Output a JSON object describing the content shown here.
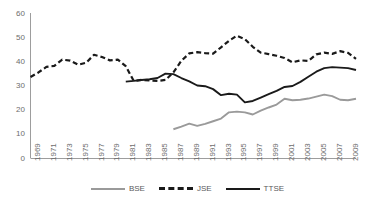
{
  "chart_data": {
    "type": "line",
    "title": "",
    "subtitle": "",
    "xlabel": "",
    "ylabel": "",
    "ylim": [
      0,
      60
    ],
    "ytick_values": [
      0,
      10,
      20,
      30,
      40,
      50,
      60
    ],
    "ytick_labels": [
      "0",
      "10",
      "20",
      "30",
      "40",
      "50",
      "60"
    ],
    "grid": false,
    "legend_position": "bottom",
    "x": [
      1969,
      1970,
      1971,
      1972,
      1973,
      1974,
      1975,
      1976,
      1977,
      1978,
      1979,
      1980,
      1981,
      1982,
      1983,
      1984,
      1985,
      1986,
      1987,
      1988,
      1989,
      1990,
      1991,
      1992,
      1993,
      1994,
      1995,
      1996,
      1997,
      1998,
      1999,
      2000,
      2001,
      2002,
      2003,
      2004,
      2005,
      2006,
      2007,
      2008,
      2009,
      2010
    ],
    "xtick_labels": [
      "1969",
      "1971",
      "1973",
      "1975",
      "1977",
      "1979",
      "1981",
      "1983",
      "1985",
      "1987",
      "1989",
      "1991",
      "1993",
      "1995",
      "1997",
      "1999",
      "2001",
      "2003",
      "2005",
      "2007",
      "2009"
    ],
    "series": [
      {
        "name": "BSE",
        "color": "#9a9a9a",
        "style": "solid",
        "start_year": 1987,
        "values": [
          null,
          null,
          null,
          null,
          null,
          null,
          null,
          null,
          null,
          null,
          null,
          null,
          null,
          null,
          null,
          null,
          null,
          null,
          11.9,
          13.0,
          14.2,
          13.3,
          14.1,
          15.2,
          16.3,
          18.9,
          19.2,
          18.9,
          18.0,
          19.6,
          20.9,
          22.1,
          24.5,
          23.9,
          24.1,
          24.6,
          25.4,
          26.2,
          25.6,
          24.1,
          23.9,
          24.5
        ]
      },
      {
        "name": "JSE",
        "color": "#1a1a1a",
        "style": "dashed",
        "start_year": 1969,
        "values": [
          33.5,
          35.4,
          37.7,
          38.1,
          40.7,
          40.3,
          38.6,
          39.4,
          42.7,
          41.8,
          40.4,
          40.7,
          38.0,
          31.9,
          32.3,
          32.1,
          31.9,
          32.3,
          35.4,
          40.2,
          43.3,
          43.8,
          43.4,
          43.2,
          45.8,
          48.5,
          50.6,
          49.2,
          46.0,
          43.6,
          43.0,
          42.3,
          41.4,
          39.6,
          40.4,
          40.2,
          42.9,
          43.6,
          43.1,
          44.2,
          43.5,
          41.0
        ]
      },
      {
        "name": "TTSE",
        "color": "#1a1a1a",
        "style": "solid",
        "start_year": 1981,
        "values": [
          null,
          null,
          null,
          null,
          null,
          null,
          null,
          null,
          null,
          null,
          null,
          null,
          31.6,
          31.9,
          32.3,
          32.6,
          33.1,
          34.9,
          34.7,
          33.1,
          31.7,
          30.0,
          29.7,
          28.5,
          26.0,
          26.6,
          26.2,
          23.0,
          23.6,
          25.0,
          26.4,
          27.8,
          29.4,
          29.8,
          31.5,
          33.6,
          35.7,
          37.2,
          37.6,
          37.4,
          37.2,
          36.4
        ]
      }
    ]
  },
  "legend": {
    "items": [
      {
        "label": "BSE"
      },
      {
        "label": "JSE"
      },
      {
        "label": "TTSE"
      }
    ]
  },
  "caption": {
    "text": ""
  }
}
